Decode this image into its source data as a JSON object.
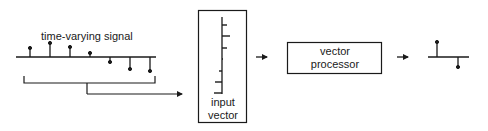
{
  "diagram": {
    "colors": {
      "stroke": "#1a1a1a",
      "background": "#ffffff"
    },
    "input_signal": {
      "label": "time-varying signal",
      "samples": [
        {
          "x": 30,
          "direction": "up",
          "tip_y": 48
        },
        {
          "x": 50,
          "direction": "up",
          "tip_y": 43
        },
        {
          "x": 70,
          "direction": "up",
          "tip_y": 47
        },
        {
          "x": 90,
          "direction": "up",
          "tip_y": 53
        },
        {
          "x": 110,
          "direction": "down",
          "tip_y": 62
        },
        {
          "x": 130,
          "direction": "down",
          "tip_y": 69
        },
        {
          "x": 150,
          "direction": "down",
          "tip_y": 71
        }
      ]
    },
    "input_vector": {
      "label_line1": "input",
      "label_line2": "vector",
      "elements": [
        {
          "y": 25,
          "direction": "right",
          "length": 5
        },
        {
          "y": 36,
          "direction": "right",
          "length": 8
        },
        {
          "y": 48,
          "direction": "right",
          "length": 5
        },
        {
          "y": 59,
          "direction": "right",
          "length": 1
        },
        {
          "y": 71,
          "direction": "left",
          "length": 3
        },
        {
          "y": 82,
          "direction": "left",
          "length": 7
        },
        {
          "y": 93,
          "direction": "left",
          "length": 8
        }
      ]
    },
    "processor": {
      "label_line1": "vector",
      "label_line2": "processor"
    },
    "output_signal": {
      "samples": [
        {
          "x": 437,
          "direction": "up",
          "tip_y": 42
        },
        {
          "x": 458,
          "direction": "down",
          "tip_y": 67
        }
      ]
    },
    "arrows": [
      {
        "name": "bracket-to-input-vector",
        "from": "time-varying signal",
        "to": "input vector"
      },
      {
        "name": "input-vector-to-processor",
        "from": "input vector",
        "to": "vector processor"
      },
      {
        "name": "processor-to-output",
        "from": "vector processor",
        "to": "output signal"
      }
    ]
  }
}
